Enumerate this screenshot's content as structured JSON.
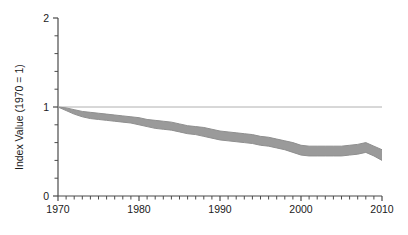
{
  "chart_data": {
    "type": "line",
    "title": "",
    "subtitle": "",
    "xlabel": "",
    "ylabel": "Index Value (1970 = 1)",
    "xlim": [
      1970,
      2010
    ],
    "ylim": [
      0,
      2
    ],
    "grid": "horizontal-reference-line-at-1",
    "legend": "none",
    "reference_line": {
      "y": 1,
      "color": "#b0b0b0"
    },
    "band": {
      "name": "Index range",
      "fill_color": "#9a9a9a",
      "description": "Shaded band between upper and lower index bounds"
    },
    "x": [
      1970,
      1971,
      1972,
      1973,
      1974,
      1975,
      1976,
      1977,
      1978,
      1979,
      1980,
      1981,
      1982,
      1983,
      1984,
      1985,
      1986,
      1987,
      1988,
      1989,
      1990,
      1991,
      1992,
      1993,
      1994,
      1995,
      1996,
      1997,
      1998,
      1999,
      2000,
      2001,
      2002,
      2003,
      2004,
      2005,
      2006,
      2007,
      2008,
      2009,
      2010
    ],
    "series": [
      {
        "name": "Upper bound",
        "color": "#9a9a9a",
        "values": [
          1.0,
          0.99,
          0.97,
          0.95,
          0.94,
          0.93,
          0.92,
          0.91,
          0.9,
          0.89,
          0.88,
          0.86,
          0.85,
          0.84,
          0.83,
          0.81,
          0.79,
          0.78,
          0.77,
          0.75,
          0.73,
          0.72,
          0.71,
          0.7,
          0.69,
          0.67,
          0.66,
          0.64,
          0.62,
          0.6,
          0.57,
          0.56,
          0.56,
          0.56,
          0.56,
          0.56,
          0.57,
          0.58,
          0.6,
          0.56,
          0.52
        ]
      },
      {
        "name": "Lower bound",
        "color": "#9a9a9a",
        "values": [
          1.0,
          0.96,
          0.92,
          0.89,
          0.87,
          0.86,
          0.85,
          0.84,
          0.83,
          0.82,
          0.8,
          0.78,
          0.76,
          0.75,
          0.74,
          0.72,
          0.7,
          0.69,
          0.67,
          0.65,
          0.63,
          0.62,
          0.61,
          0.6,
          0.59,
          0.57,
          0.56,
          0.54,
          0.52,
          0.49,
          0.46,
          0.45,
          0.45,
          0.45,
          0.45,
          0.45,
          0.46,
          0.47,
          0.49,
          0.45,
          0.4
        ]
      }
    ],
    "yticks": [
      0,
      1,
      2
    ],
    "ytick_labels": [
      "0",
      "1",
      "2"
    ],
    "yminor_step": 0.2,
    "xticks": [
      1970,
      1980,
      1990,
      2000,
      2010
    ],
    "xtick_labels": [
      "1970",
      "1980",
      "1990",
      "2000",
      "2010"
    ],
    "xminor_step": 1
  },
  "axes": {
    "y_axis_title": "Index Value (1970 = 1)"
  }
}
